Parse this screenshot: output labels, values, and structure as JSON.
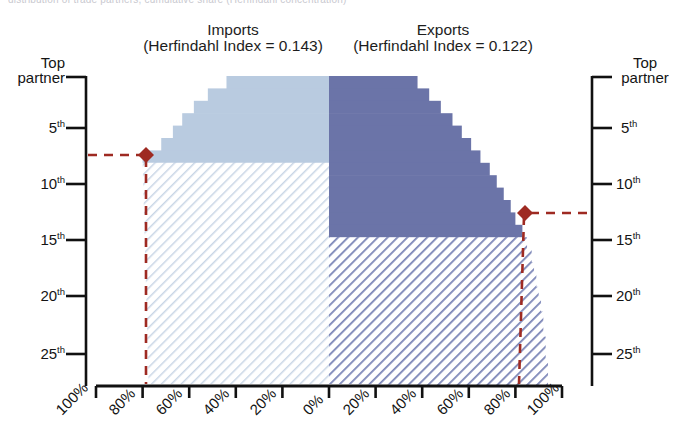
{
  "figure": {
    "clipped_top_text": "distribution of trade partners, cumulative share (Herfindahl concentration)",
    "left_axis_title_line1": "Top",
    "left_axis_title_line2": "partner",
    "right_axis_title_line1": "Top",
    "right_axis_title_line2": "partner"
  },
  "panels": {
    "imports": {
      "title": "Imports",
      "subtitle": "(Herfindahl Index = 0.143)",
      "index": 0.143
    },
    "exports": {
      "title": "Exports",
      "subtitle": "(Herfindahl Index = 0.122)",
      "index": 0.122
    }
  },
  "axes": {
    "y_ticks": [
      "Top partner",
      "5",
      "10",
      "15",
      "20",
      "25"
    ],
    "y_tick_suffix": "th",
    "y_values": [
      1,
      5,
      10,
      15,
      20,
      25
    ],
    "x_ticks": [
      "100%",
      "80%",
      "60%",
      "40%",
      "20%",
      "0%",
      "20%",
      "40%",
      "60%",
      "80%",
      "100%"
    ],
    "x_values": [
      -100,
      -80,
      -60,
      -40,
      -20,
      0,
      20,
      40,
      60,
      80,
      100
    ]
  },
  "markers": {
    "imports_marker_rank": "7th",
    "imports_marker_share": "80%",
    "exports_marker_rank": "13th",
    "exports_marker_share": "80%"
  },
  "colors": {
    "imports_solid": "#b9cbe0",
    "imports_hatch": "#c3d2e2",
    "exports_solid": "#6b74a8",
    "exports_hatch": "#7a84b4",
    "marker": "#9e2a22",
    "dashed": "#9e2a22",
    "axis": "#111111"
  },
  "chart_data": {
    "type": "bar",
    "subtitle": "Imports (Herfindahl Index = 0.143) vs Exports (Herfindahl Index = 0.122)",
    "xlabel": "",
    "ylabel": "Partner rank",
    "xlim": [
      -100,
      100
    ],
    "ylim": [
      1,
      25
    ],
    "grid": false,
    "legend": "none",
    "orientation": "horizontal-diverging",
    "categories": [
      "Top partner",
      "2nd",
      "3rd",
      "4th",
      "5th",
      "6th",
      "7th",
      "8th",
      "9th",
      "10th",
      "11th",
      "12th",
      "13th",
      "14th",
      "15th",
      "16th",
      "17th",
      "18th",
      "19th",
      "20th",
      "21st",
      "22nd",
      "23rd",
      "24th",
      "25th"
    ],
    "series": [
      {
        "name": "Imports (cumulative %, plotted leftward)",
        "values": [
          44,
          52,
          58,
          63,
          67,
          72,
          80,
          80,
          80,
          80,
          80,
          80,
          80,
          80,
          80,
          80,
          80,
          80,
          80,
          80,
          80,
          80,
          80,
          80,
          80
        ],
        "solid_until_rank": 7,
        "hatched_from_rank": 8,
        "color": "#b9cbe0"
      },
      {
        "name": "Exports (cumulative %, plotted rightward)",
        "values": [
          38,
          43,
          48,
          53,
          57,
          61,
          65,
          69,
          72,
          75,
          78,
          80,
          83,
          85,
          87,
          88,
          89,
          90,
          91,
          92,
          92,
          93,
          93,
          94,
          94
        ],
        "solid_until_rank": 13,
        "hatched_from_rank": 14,
        "color": "#6b74a8"
      }
    ],
    "annotations": [
      {
        "label": "imports 80% reached at 7th partner",
        "x": -80,
        "y": 7,
        "marker": "diamond",
        "color": "#9e2a22"
      },
      {
        "label": "exports 80% reached at 13th partner",
        "x": 80,
        "y": 13,
        "marker": "diamond",
        "color": "#9e2a22"
      }
    ]
  }
}
